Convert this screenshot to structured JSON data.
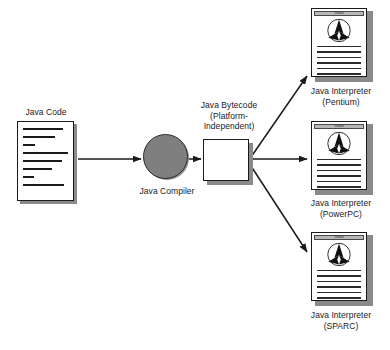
{
  "diagram": {
    "nodes": {
      "java_code": {
        "label": "Java Code",
        "icon": "document-icon",
        "code_line_widths": [
          88,
          70,
          26,
          100,
          86,
          64,
          24,
          92
        ]
      },
      "compiler": {
        "label": "Java Compiler",
        "icon": "circle-process-icon",
        "fill_color": "#7f7f7f"
      },
      "bytecode": {
        "label_line1": "Java Bytecode",
        "label_line2": "(Platform-",
        "label_line3": "Independent)",
        "icon": "square-box-icon",
        "fill_color": "#ffffff"
      }
    },
    "interpreters": [
      {
        "name": "pentium",
        "label_line1": "Java Interpreter",
        "label_line2": "(Pentium)",
        "titlebar_text": "Window",
        "icon": "java-triangle-logo-icon",
        "text_line_count": 6
      },
      {
        "name": "powerpc",
        "label_line1": "Java Interpreter",
        "label_line2": "(PowerPC)",
        "titlebar_text": "Window",
        "icon": "java-triangle-logo-icon",
        "text_line_count": 6
      },
      {
        "name": "sparc",
        "label_line1": "Java Interpreter",
        "label_line2": "(SPARC)",
        "titlebar_text": "Window",
        "icon": "java-triangle-logo-icon",
        "text_line_count": 6
      }
    ],
    "colors": {
      "stroke": "#1a1a1a",
      "shadow": "#8a8a8a",
      "compiler_fill": "#7f7f7f",
      "titlebar_fill": "#b8b8b8",
      "background": "#ffffff"
    }
  }
}
